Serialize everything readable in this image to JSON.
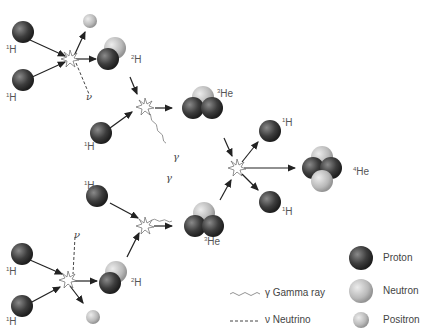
{
  "labels": {
    "hydrogen": "H",
    "hydrogen_mass": "1",
    "deuterium": "H",
    "deuterium_mass": "2",
    "helium3": "He",
    "helium3_mass": "3",
    "helium4": "He",
    "helium4_mass": "4",
    "gamma": "γ",
    "neutrino": "ν"
  },
  "legend": {
    "gamma_ray": "γ  Gamma ray",
    "neutrino": "ν Neutrino",
    "proton": "Proton",
    "neutron": "Neutron",
    "positron": "Positron"
  },
  "colors": {
    "proton": "#3a3a3a",
    "neutron": "#bdbdbd",
    "positron": "#c8c8c8",
    "arrow": "#222222"
  }
}
